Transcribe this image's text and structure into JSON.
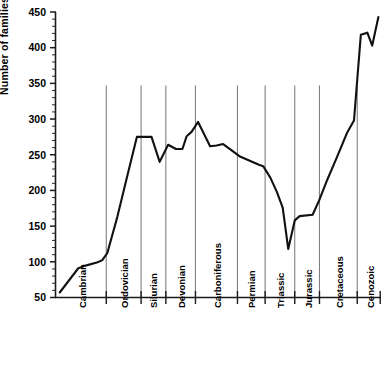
{
  "chart_data": {
    "type": "line",
    "title": "",
    "xlabel": "",
    "ylabel": "Number of families",
    "ylim": [
      50,
      450
    ],
    "ytick_labels": [
      "50",
      "100",
      "150",
      "200",
      "250",
      "300",
      "350",
      "400",
      "450"
    ],
    "ytick_values": [
      50,
      100,
      150,
      200,
      250,
      300,
      350,
      400,
      450
    ],
    "yminor_step": 10,
    "grid": "vertical-period-boundaries",
    "legend": "none",
    "xlim": [
      0,
      100
    ],
    "categories": [
      "Cambrian",
      "Ordovician",
      "Silurian",
      "Devonian",
      "Carboniferous",
      "Permian",
      "Triassic",
      "Jurassic",
      "Cretaceous",
      "Cenozoic"
    ],
    "period_boundaries_x": [
      15.6,
      26.3,
      33.9,
      43.0,
      55.9,
      64.4,
      73.5,
      81.1,
      92.7
    ],
    "period_label_centers_x": [
      8.0,
      21.0,
      30.0,
      38.5,
      49.5,
      60.0,
      69.0,
      77.5,
      87.0,
      96.5
    ],
    "series": [
      {
        "name": "Number of families",
        "points": [
          [
            1.3,
            57
          ],
          [
            7.0,
            91
          ],
          [
            9.5,
            95
          ],
          [
            12.7,
            99
          ],
          [
            14.3,
            102
          ],
          [
            15.9,
            112
          ],
          [
            19.0,
            163
          ],
          [
            22.2,
            223
          ],
          [
            25.0,
            275
          ],
          [
            29.5,
            275
          ],
          [
            32.0,
            240
          ],
          [
            34.6,
            264
          ],
          [
            37.0,
            258
          ],
          [
            39.0,
            258
          ],
          [
            40.3,
            276
          ],
          [
            41.8,
            282
          ],
          [
            43.8,
            296
          ],
          [
            47.5,
            262
          ],
          [
            49.5,
            263
          ],
          [
            51.5,
            265
          ],
          [
            53.6,
            258
          ],
          [
            56.5,
            248
          ],
          [
            59.5,
            242
          ],
          [
            62.5,
            236
          ],
          [
            63.8,
            234
          ],
          [
            66.0,
            218
          ],
          [
            68.0,
            198
          ],
          [
            69.8,
            176
          ],
          [
            71.5,
            118
          ],
          [
            73.5,
            158
          ],
          [
            75.0,
            164
          ],
          [
            79.0,
            166
          ],
          [
            81.0,
            186
          ],
          [
            83.5,
            215
          ],
          [
            86.5,
            247
          ],
          [
            89.5,
            280
          ],
          [
            91.7,
            298
          ],
          [
            93.8,
            418
          ],
          [
            95.8,
            421
          ],
          [
            97.3,
            403
          ],
          [
            99.2,
            443
          ]
        ]
      }
    ]
  }
}
